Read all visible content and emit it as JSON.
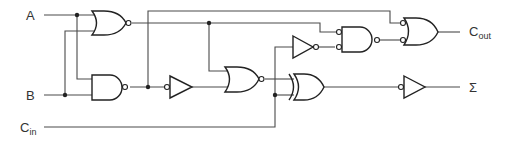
{
  "diagram": {
    "inputs": {
      "a": {
        "label": "A"
      },
      "b": {
        "label": "B"
      },
      "cin": {
        "label": "C",
        "sub": "in"
      }
    },
    "outputs": {
      "cout": {
        "label": "C",
        "sub": "out"
      },
      "sum": {
        "label": "Σ"
      }
    },
    "gates": [
      {
        "id": "g1",
        "type": "NOR",
        "inputs": [
          "A",
          "B"
        ]
      },
      {
        "id": "g2",
        "type": "NAND",
        "inputs": [
          "A",
          "B"
        ]
      },
      {
        "id": "g3",
        "type": "NOT (input bubble)",
        "inputs": [
          "g2"
        ]
      },
      {
        "id": "g4",
        "type": "NOR",
        "inputs": [
          "g1",
          "g3"
        ]
      },
      {
        "id": "g5",
        "type": "XOR",
        "inputs": [
          "g4",
          "Cin"
        ]
      },
      {
        "id": "g6",
        "type": "NOT (input bubble)",
        "inputs": [
          "g5"
        ],
        "output": "Σ"
      },
      {
        "id": "g7",
        "type": "NOT",
        "inputs": [
          "Cin"
        ]
      },
      {
        "id": "g8",
        "type": "NAND (inverted inputs)",
        "inputs": [
          "g1",
          "g7"
        ]
      },
      {
        "id": "g9",
        "type": "OR (inverted inputs)",
        "inputs": [
          "g2",
          "g8"
        ],
        "output": "Cout"
      }
    ]
  }
}
